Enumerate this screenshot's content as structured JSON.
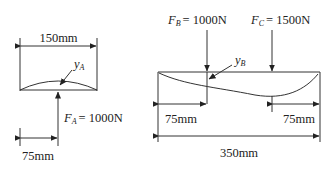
{
  "left_figure": {
    "width_dim": "150mm",
    "offset_dim": "75mm",
    "deflection_label": {
      "symbol": "y",
      "subscript": "A"
    },
    "force_label": {
      "symbol": "F",
      "subscript": "A",
      "value": "= 1000N"
    }
  },
  "right_figure": {
    "force_b_label": {
      "symbol": "F",
      "subscript": "B",
      "value": "= 1000N"
    },
    "force_c_label": {
      "symbol": "F",
      "subscript": "C",
      "value": "= 1500N"
    },
    "deflection_label": {
      "symbol": "y",
      "subscript": "B"
    },
    "left_offset_dim": "75mm",
    "right_offset_dim": "75mm",
    "total_dim": "350mm"
  }
}
